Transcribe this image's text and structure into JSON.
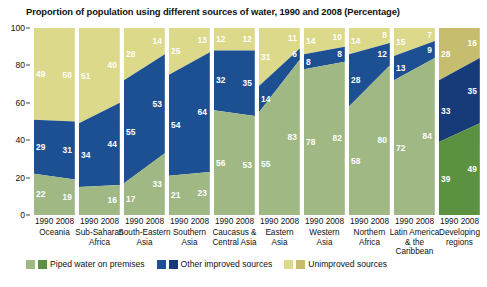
{
  "chart_data": {
    "type": "bar",
    "title": "Proportion of population using different sources of water, 1990 and 2008 (Percentage)",
    "xlabel": "",
    "ylabel": "",
    "ylim": [
      0,
      100
    ],
    "yticks": [
      0,
      20,
      40,
      60,
      80,
      100
    ],
    "grid": false,
    "legend_position": "bottom",
    "stacked": true,
    "years": [
      "1990",
      "2008"
    ],
    "categories": [
      "Oceania",
      "Sub-Saharan\nAfrica",
      "South-Eastern\nAsia",
      "Southern\nAsia",
      "Caucasus &\nCentral Asia",
      "Eastern\nAsia",
      "Western\nAsia",
      "Northern\nAfrica",
      "Latin America\n& the Caribbean",
      "Developing\nregions"
    ],
    "series": [
      {
        "name": "Piped water on premises",
        "color_1990": "#9fb884",
        "color_2008": "#9fb884",
        "values_1990": [
          22,
          35,
          17,
          21,
          56,
          55,
          78,
          58,
          72,
          39
        ],
        "values_2008": [
          19,
          16,
          33,
          23,
          53,
          83,
          82,
          80,
          84,
          49
        ]
      },
      {
        "name": "Other improved sources",
        "color_1990": "#1d4f93",
        "color_2008": "#1d4f93",
        "values_1990": [
          29,
          34,
          55,
          54,
          32,
          14,
          8,
          28,
          13,
          33
        ],
        "values_2008": [
          31,
          44,
          53,
          64,
          35,
          6,
          8,
          12,
          9,
          35
        ]
      },
      {
        "name": "Unimproved sources",
        "color_1990": "#dcd98a",
        "color_2008": "#dcd98a",
        "values_1990": [
          49,
          51,
          28,
          25,
          12,
          31,
          14,
          14,
          15,
          28
        ],
        "values_2008": [
          50,
          40,
          14,
          13,
          12,
          11,
          10,
          8,
          7,
          16
        ]
      }
    ],
    "highlight_group_index": 9,
    "highlight_colors": {
      "piped": "#5b9140",
      "other": "#173b78",
      "unimproved": "#c6bd6e"
    },
    "colors": {
      "piped": "#9fb884",
      "other": "#1d4f93",
      "unimproved": "#dcd98a",
      "axis": "#4a4a4a",
      "background": "#ffffff"
    }
  },
  "legend": {
    "items": [
      {
        "label": "Piped water on premises",
        "swatch_1990": "#9fb884",
        "swatch_2008": "#5b9140"
      },
      {
        "label": "Other improved sources",
        "swatch_1990": "#1d4f93",
        "swatch_2008": "#173b78"
      },
      {
        "label": "Unimproved sources",
        "swatch_1990": "#dcd98a",
        "swatch_2008": "#c6bd6e"
      }
    ]
  }
}
